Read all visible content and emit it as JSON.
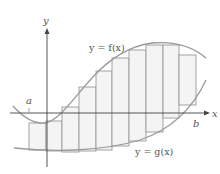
{
  "figure": {
    "labels": {
      "y_axis": "y",
      "x_axis": "x",
      "a": "a",
      "b": "b",
      "f_curve": "y = f(x)",
      "g_curve": "y = g(x)"
    },
    "colors": {
      "axis": "#444444",
      "curve": "#9a9a9a",
      "rect_stroke": "#9a9a9a",
      "rect_fill": "#f4f4f4",
      "text": "#555555"
    },
    "num_rectangles": 10
  }
}
